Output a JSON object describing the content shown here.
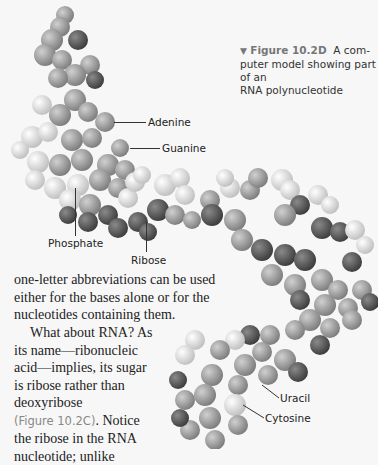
{
  "figure": {
    "marker": "▼",
    "number": "Figure 10.2D",
    "caption_lines": [
      "A com-",
      "puter model showing part of an",
      "RNA polynucleotide"
    ]
  },
  "labels": {
    "adenine": "Adenine",
    "guanine": "Guanine",
    "phosphate": "Phosphate",
    "ribose": "Ribose",
    "uracil": "Uracil",
    "cytosine": "Cytosine"
  },
  "body": {
    "lines_full": [
      "one-letter abbreviations can be used",
      "either for the bases alone or for the",
      "nucleotides containing them."
    ],
    "lines_narrow": [
      "What about RNA? As",
      "its name—ribonucleic",
      "acid—implies, its sugar",
      "is ribose rather than",
      "deoxyribose"
    ],
    "ref": "(Figure 10.2C)",
    "after_ref": ". Notice",
    "lines_end": [
      "the ribose in the RNA",
      "nucleotide; unlike"
    ]
  },
  "colors": {
    "background": "#f7f7f7",
    "text": "#222222",
    "figure_ref": "#888888",
    "atom_light": "#e6e6e6",
    "atom_mid": "#a8a8a8",
    "atom_dark": "#555555"
  }
}
